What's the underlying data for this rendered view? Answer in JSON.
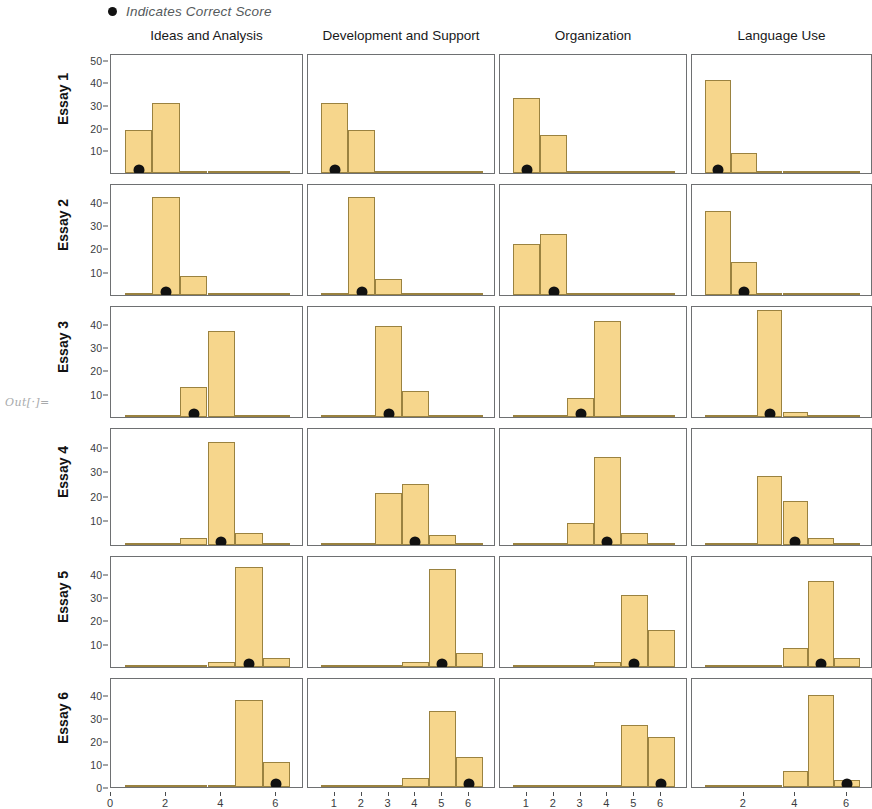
{
  "legend": {
    "marker_icon": "filled-circle-marker",
    "text": "Indicates Correct Score"
  },
  "out_label": "Out[·]=",
  "colors": {
    "bar_fill": "#F6D68C",
    "bar_edge": "#9A8240",
    "marker": "#111111",
    "panel_border": "#6E7072",
    "legend_text": "#555A5C"
  },
  "chart_data": {
    "type": "bar",
    "title": "",
    "subtitle": "",
    "xlabel": "",
    "ylabel": "",
    "grid": false,
    "legend_position": "top-left",
    "layout": {
      "rows": 6,
      "cols": 4,
      "description": "Grid of histograms: rows are essays, columns are scoring domains"
    },
    "column_titles": [
      "Ideas and Analysis",
      "Development and Support",
      "Organization",
      "Language Use"
    ],
    "row_titles": [
      "Essay 1",
      "Essay 2",
      "Essay 3",
      "Essay 4",
      "Essay 5",
      "Essay 6"
    ],
    "annotations": [
      "Black dot indicates the correct score for that essay and domain"
    ],
    "panels": [
      {
        "row": "Essay 1",
        "column": "Ideas and Analysis",
        "xticks": [
          0,
          2,
          4,
          6
        ],
        "xlim": [
          0,
          7
        ],
        "yticks": [
          10,
          20,
          30,
          40,
          50
        ],
        "ylim": [
          0,
          53
        ],
        "categories": [
          1,
          2,
          3,
          4,
          5,
          6
        ],
        "values": [
          19,
          31,
          0,
          0,
          0,
          0
        ],
        "correct_score": 1
      },
      {
        "row": "Essay 1",
        "column": "Development and Support",
        "xticks": [
          1,
          2,
          3,
          4,
          5,
          6
        ],
        "xlim": [
          0,
          7
        ],
        "yticks": [
          10,
          20,
          30,
          40,
          50
        ],
        "ylim": [
          0,
          53
        ],
        "categories": [
          1,
          2,
          3,
          4,
          5,
          6
        ],
        "values": [
          31,
          19,
          0,
          0,
          0,
          0
        ],
        "correct_score": 1
      },
      {
        "row": "Essay 1",
        "column": "Organization",
        "xticks": [
          1,
          2,
          3,
          4,
          5,
          6
        ],
        "xlim": [
          0,
          7
        ],
        "yticks": [
          10,
          20,
          30,
          40,
          50
        ],
        "ylim": [
          0,
          53
        ],
        "categories": [
          1,
          2,
          3,
          4,
          5,
          6
        ],
        "values": [
          33,
          17,
          0,
          0,
          0,
          0
        ],
        "correct_score": 1
      },
      {
        "row": "Essay 1",
        "column": "Language Use",
        "xticks": [
          2,
          4,
          6
        ],
        "xlim": [
          0,
          7
        ],
        "yticks": [
          10,
          20,
          30,
          40,
          50
        ],
        "ylim": [
          0,
          53
        ],
        "categories": [
          1,
          2,
          3,
          4,
          5,
          6
        ],
        "values": [
          41,
          9,
          0,
          0,
          0,
          0
        ],
        "correct_score": 1
      },
      {
        "row": "Essay 2",
        "column": "Ideas and Analysis",
        "xticks": [
          0,
          2,
          4,
          6
        ],
        "xlim": [
          0,
          7
        ],
        "yticks": [
          10,
          20,
          30,
          40
        ],
        "ylim": [
          0,
          48
        ],
        "categories": [
          1,
          2,
          3,
          4,
          5,
          6
        ],
        "values": [
          0,
          42,
          8,
          0,
          0,
          0
        ],
        "correct_score": 2
      },
      {
        "row": "Essay 2",
        "column": "Development and Support",
        "xticks": [
          1,
          2,
          3,
          4,
          5,
          6
        ],
        "xlim": [
          0,
          7
        ],
        "yticks": [
          10,
          20,
          30,
          40
        ],
        "ylim": [
          0,
          48
        ],
        "categories": [
          1,
          2,
          3,
          4,
          5,
          6
        ],
        "values": [
          1,
          42,
          7,
          0,
          0,
          0
        ],
        "correct_score": 2
      },
      {
        "row": "Essay 2",
        "column": "Organization",
        "xticks": [
          1,
          2,
          3,
          4,
          5,
          6
        ],
        "xlim": [
          0,
          7
        ],
        "yticks": [
          10,
          20,
          30,
          40
        ],
        "ylim": [
          0,
          48
        ],
        "categories": [
          1,
          2,
          3,
          4,
          5,
          6
        ],
        "values": [
          22,
          26,
          1,
          0,
          0,
          0
        ],
        "correct_score": 2
      },
      {
        "row": "Essay 2",
        "column": "Language Use",
        "xticks": [
          2,
          4,
          6
        ],
        "xlim": [
          0,
          7
        ],
        "yticks": [
          10,
          20,
          30,
          40
        ],
        "ylim": [
          0,
          48
        ],
        "categories": [
          1,
          2,
          3,
          4,
          5,
          6
        ],
        "values": [
          36,
          14,
          0,
          0,
          0,
          0
        ],
        "correct_score": 2
      },
      {
        "row": "Essay 3",
        "column": "Ideas and Analysis",
        "xticks": [
          0,
          2,
          4,
          6
        ],
        "xlim": [
          0,
          7
        ],
        "yticks": [
          10,
          20,
          30,
          40
        ],
        "ylim": [
          0,
          48
        ],
        "categories": [
          1,
          2,
          3,
          4,
          5,
          6
        ],
        "values": [
          0,
          0,
          13,
          37,
          0,
          0
        ],
        "correct_score": 3
      },
      {
        "row": "Essay 3",
        "column": "Development and Support",
        "xticks": [
          1,
          2,
          3,
          4,
          5,
          6
        ],
        "xlim": [
          0,
          7
        ],
        "yticks": [
          10,
          20,
          30,
          40
        ],
        "ylim": [
          0,
          48
        ],
        "categories": [
          1,
          2,
          3,
          4,
          5,
          6
        ],
        "values": [
          0,
          0,
          39,
          11,
          0,
          0
        ],
        "correct_score": 3
      },
      {
        "row": "Essay 3",
        "column": "Organization",
        "xticks": [
          1,
          2,
          3,
          4,
          5,
          6
        ],
        "xlim": [
          0,
          7
        ],
        "yticks": [
          10,
          20,
          30,
          40
        ],
        "ylim": [
          0,
          48
        ],
        "categories": [
          1,
          2,
          3,
          4,
          5,
          6
        ],
        "values": [
          0,
          0,
          8,
          41,
          0,
          0
        ],
        "correct_score": 3
      },
      {
        "row": "Essay 3",
        "column": "Language Use",
        "xticks": [
          2,
          4,
          6
        ],
        "xlim": [
          0,
          7
        ],
        "yticks": [
          10,
          20,
          30,
          40
        ],
        "ylim": [
          0,
          48
        ],
        "categories": [
          1,
          2,
          3,
          4,
          5,
          6
        ],
        "values": [
          0,
          0,
          46,
          2,
          0,
          0
        ],
        "correct_score": 3
      },
      {
        "row": "Essay 4",
        "column": "Ideas and Analysis",
        "xticks": [
          0,
          2,
          4,
          6
        ],
        "xlim": [
          0,
          7
        ],
        "yticks": [
          10,
          20,
          30,
          40
        ],
        "ylim": [
          0,
          48
        ],
        "categories": [
          1,
          2,
          3,
          4,
          5,
          6
        ],
        "values": [
          0,
          0,
          3,
          42,
          5,
          0
        ],
        "correct_score": 4
      },
      {
        "row": "Essay 4",
        "column": "Development and Support",
        "xticks": [
          1,
          2,
          3,
          4,
          5,
          6
        ],
        "xlim": [
          0,
          7
        ],
        "yticks": [
          10,
          20,
          30,
          40
        ],
        "ylim": [
          0,
          48
        ],
        "categories": [
          1,
          2,
          3,
          4,
          5,
          6
        ],
        "values": [
          0,
          0,
          21,
          25,
          4,
          0
        ],
        "correct_score": 4
      },
      {
        "row": "Essay 4",
        "column": "Organization",
        "xticks": [
          1,
          2,
          3,
          4,
          5,
          6
        ],
        "xlim": [
          0,
          7
        ],
        "yticks": [
          10,
          20,
          30,
          40
        ],
        "ylim": [
          0,
          48
        ],
        "categories": [
          1,
          2,
          3,
          4,
          5,
          6
        ],
        "values": [
          0,
          0,
          9,
          36,
          5,
          0
        ],
        "correct_score": 4
      },
      {
        "row": "Essay 4",
        "column": "Language Use",
        "xticks": [
          2,
          4,
          6
        ],
        "xlim": [
          0,
          7
        ],
        "yticks": [
          10,
          20,
          30,
          40
        ],
        "ylim": [
          0,
          48
        ],
        "categories": [
          1,
          2,
          3,
          4,
          5,
          6
        ],
        "values": [
          0,
          0,
          28,
          18,
          3,
          0
        ],
        "correct_score": 4
      },
      {
        "row": "Essay 5",
        "column": "Ideas and Analysis",
        "xticks": [
          0,
          2,
          4,
          6
        ],
        "xlim": [
          0,
          7
        ],
        "yticks": [
          10,
          20,
          30,
          40
        ],
        "ylim": [
          0,
          48
        ],
        "categories": [
          1,
          2,
          3,
          4,
          5,
          6
        ],
        "values": [
          0,
          0,
          0,
          2,
          43,
          4
        ],
        "correct_score": 5
      },
      {
        "row": "Essay 5",
        "column": "Development and Support",
        "xticks": [
          1,
          2,
          3,
          4,
          5,
          6
        ],
        "xlim": [
          0,
          7
        ],
        "yticks": [
          10,
          20,
          30,
          40
        ],
        "ylim": [
          0,
          48
        ],
        "categories": [
          1,
          2,
          3,
          4,
          5,
          6
        ],
        "values": [
          0,
          0,
          0,
          2,
          42,
          6
        ],
        "correct_score": 5
      },
      {
        "row": "Essay 5",
        "column": "Organization",
        "xticks": [
          1,
          2,
          3,
          4,
          5,
          6
        ],
        "xlim": [
          0,
          7
        ],
        "yticks": [
          10,
          20,
          30,
          40
        ],
        "ylim": [
          0,
          48
        ],
        "categories": [
          1,
          2,
          3,
          4,
          5,
          6
        ],
        "values": [
          0,
          0,
          0,
          2,
          31,
          16
        ],
        "correct_score": 5
      },
      {
        "row": "Essay 5",
        "column": "Language Use",
        "xticks": [
          2,
          4,
          6
        ],
        "xlim": [
          0,
          7
        ],
        "yticks": [
          10,
          20,
          30,
          40
        ],
        "ylim": [
          0,
          48
        ],
        "categories": [
          1,
          2,
          3,
          4,
          5,
          6
        ],
        "values": [
          0,
          0,
          0,
          8,
          37,
          4
        ],
        "correct_score": 5
      },
      {
        "row": "Essay 6",
        "column": "Ideas and Analysis",
        "xticks": [
          0,
          2,
          4,
          6
        ],
        "xlim": [
          0,
          7
        ],
        "yticks": [
          0,
          10,
          20,
          30,
          40
        ],
        "ylim": [
          0,
          48
        ],
        "categories": [
          1,
          2,
          3,
          4,
          5,
          6
        ],
        "values": [
          0,
          0,
          0,
          1,
          38,
          11
        ],
        "correct_score": 6
      },
      {
        "row": "Essay 6",
        "column": "Development and Support",
        "xticks": [
          1,
          2,
          3,
          4,
          5,
          6
        ],
        "xlim": [
          0,
          7
        ],
        "yticks": [
          0,
          10,
          20,
          30,
          40
        ],
        "ylim": [
          0,
          48
        ],
        "categories": [
          1,
          2,
          3,
          4,
          5,
          6
        ],
        "values": [
          0,
          0,
          0,
          4,
          33,
          13
        ],
        "correct_score": 6
      },
      {
        "row": "Essay 6",
        "column": "Organization",
        "xticks": [
          1,
          2,
          3,
          4,
          5,
          6
        ],
        "xlim": [
          0,
          7
        ],
        "yticks": [
          0,
          10,
          20,
          30,
          40
        ],
        "ylim": [
          0,
          48
        ],
        "categories": [
          1,
          2,
          3,
          4,
          5,
          6
        ],
        "values": [
          0,
          0,
          0,
          1,
          27,
          22
        ],
        "correct_score": 6
      },
      {
        "row": "Essay 6",
        "column": "Language Use",
        "xticks": [
          2,
          4,
          6
        ],
        "xlim": [
          0,
          7
        ],
        "yticks": [
          0,
          10,
          20,
          30,
          40
        ],
        "ylim": [
          0,
          48
        ],
        "categories": [
          1,
          2,
          3,
          4,
          5,
          6
        ],
        "values": [
          0,
          0,
          0,
          7,
          40,
          3
        ],
        "correct_score": 6
      }
    ]
  }
}
